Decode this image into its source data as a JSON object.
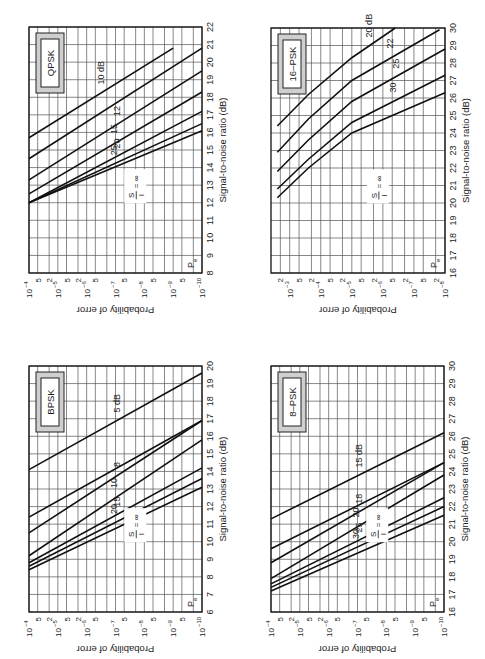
{
  "figure": {
    "orientation": "rotated-90-ccw",
    "shared_xlabel": "Signal-to-noise ratio (dB)",
    "shared_ylabel": "Probability of error",
    "pe_label": "P",
    "pe_subscript": "e",
    "si_label": {
      "num": "S",
      "den": "I",
      "eq": "= ∞"
    }
  },
  "chart_data": [
    {
      "id": "bpsk",
      "type": "line",
      "title": "BPSK",
      "xlabel": "Signal-to-noise ratio (dB)",
      "ylabel": "Probability of error",
      "xlim": [
        6,
        20
      ],
      "ylim": [
        1e-10,
        0.0001
      ],
      "yscale": "log",
      "grid": true,
      "x_ticks": [
        6,
        7,
        8,
        9,
        10,
        11,
        12,
        13,
        14,
        15,
        16,
        17,
        18,
        19,
        20
      ],
      "y_tick_labels": [
        "10⁻⁴",
        "5",
        "2",
        "10⁻⁵",
        "5",
        "2",
        "10⁻⁶",
        "5",
        "10⁻⁷",
        "5",
        "10⁻⁸",
        "5",
        "10⁻⁹",
        "5",
        "10⁻¹⁰"
      ],
      "series": [
        {
          "name": "S/I = ∞",
          "label": "",
          "x": [
            8.4,
            13.1
          ],
          "y": [
            0.0001,
            1e-10
          ]
        },
        {
          "name": "20 dB",
          "label": "20",
          "x": [
            8.6,
            13.6
          ],
          "y": [
            0.0001,
            1e-10
          ]
        },
        {
          "name": "15 dB",
          "label": "15",
          "x": [
            8.8,
            14.2
          ],
          "y": [
            0.0001,
            1e-10
          ]
        },
        {
          "name": "10 dB",
          "label": "10",
          "x": [
            9.2,
            15.8
          ],
          "y": [
            0.0001,
            1e-10
          ]
        },
        {
          "name": "8 dB",
          "label": "8",
          "x": [
            10.5,
            16.9
          ],
          "y": [
            0.0001,
            1e-10
          ]
        },
        {
          "name": "8 dB top",
          "label": "",
          "x": [
            11.4,
            16.9
          ],
          "y": [
            0.0001,
            1e-10
          ]
        },
        {
          "name": "5 dB",
          "label": "5 dB",
          "x": [
            14.1,
            19.6
          ],
          "y": [
            0.0001,
            1e-10
          ]
        }
      ]
    },
    {
      "id": "qpsk",
      "type": "line",
      "title": "QPSK",
      "xlabel": "Signal-to-noise ratio (dB)",
      "ylabel": "Probability of error",
      "xlim": [
        8,
        22
      ],
      "ylim": [
        1e-10,
        0.0001
      ],
      "yscale": "log",
      "grid": true,
      "x_ticks": [
        8,
        9,
        10,
        11,
        12,
        13,
        14,
        15,
        16,
        17,
        18,
        19,
        20,
        21,
        22
      ],
      "y_tick_labels": [
        "10⁻⁴",
        "5",
        "2",
        "10⁻⁵",
        "5",
        "2",
        "10⁻⁶",
        "5",
        "10⁻⁷",
        "5",
        "10⁻⁸",
        "5",
        "10⁻⁹",
        "5",
        "10⁻¹⁰"
      ],
      "series": [
        {
          "name": "S/I = ∞",
          "label": "",
          "x": [
            12.0,
            16.1
          ],
          "y": [
            0.0001,
            1e-10
          ]
        },
        {
          "name": "25 dB",
          "label": "25",
          "x": [
            12.0,
            16.5
          ],
          "y": [
            0.0001,
            1e-10
          ]
        },
        {
          "name": "20 dB",
          "label": "20",
          "x": [
            12.0,
            17.2
          ],
          "y": [
            0.0001,
            1e-10
          ]
        },
        {
          "name": "15 dB",
          "label": "15",
          "x": [
            12.5,
            18.3
          ],
          "y": [
            0.0001,
            1e-10
          ]
        },
        {
          "name": "12 dB",
          "label": "12",
          "x": [
            13.3,
            19.5
          ],
          "y": [
            0.0001,
            1e-10
          ]
        },
        {
          "name": "10 dB a",
          "label": "",
          "x": [
            14.5,
            20.8
          ],
          "y": [
            0.0001,
            1e-10
          ]
        },
        {
          "name": "10 dB",
          "label": "10 dB",
          "x": [
            15.7,
            20.8
          ],
          "y": [
            0.0001,
            1e-09
          ]
        }
      ]
    },
    {
      "id": "8psk",
      "type": "line",
      "title": "8–PSK",
      "xlabel": "Signal-to-noise ratio (dB)",
      "ylabel": "Probability of error",
      "xlim": [
        16,
        30
      ],
      "ylim": [
        1e-10,
        0.0001
      ],
      "yscale": "log",
      "grid": true,
      "x_ticks": [
        16,
        17,
        18,
        19,
        20,
        21,
        22,
        23,
        24,
        25,
        26,
        27,
        28,
        29,
        30
      ],
      "y_tick_labels": [
        "10⁻⁴",
        "5",
        "2",
        "10⁻⁵",
        "5",
        "2",
        "10⁻⁶",
        "5",
        "10⁻⁷",
        "5",
        "10⁻⁸",
        "5",
        "10⁻⁹",
        "5",
        "10⁻¹⁰"
      ],
      "series": [
        {
          "name": "S/I = ∞",
          "label": "",
          "x": [
            17.2,
            21.5
          ],
          "y": [
            0.0001,
            1e-10
          ]
        },
        {
          "name": "30 dB",
          "label": "30",
          "x": [
            17.4,
            22.0
          ],
          "y": [
            0.0001,
            1e-10
          ]
        },
        {
          "name": "25 dB",
          "label": "25",
          "x": [
            17.6,
            22.5
          ],
          "y": [
            0.0001,
            1e-10
          ]
        },
        {
          "name": "20 dB",
          "label": "20",
          "x": [
            17.9,
            23.8
          ],
          "y": [
            0.0001,
            1e-10
          ]
        },
        {
          "name": "18 dB",
          "label": "18",
          "x": [
            18.8,
            24.5
          ],
          "y": [
            0.0001,
            1e-10
          ]
        },
        {
          "name": "18 dB b",
          "label": "",
          "x": [
            19.6,
            24.5
          ],
          "y": [
            0.0001,
            1e-10
          ]
        },
        {
          "name": "15 dB",
          "label": "15 dB",
          "x": [
            21.3,
            26.2
          ],
          "y": [
            0.0001,
            1e-10
          ]
        }
      ]
    },
    {
      "id": "16psk",
      "type": "line",
      "title": "16–PSK",
      "xlabel": "Signal-to-noise ratio (dB)",
      "ylabel": "Probability of error",
      "xlim": [
        16,
        30
      ],
      "ylim": [
        1e-08,
        0.004
      ],
      "yscale": "log",
      "grid": true,
      "x_ticks": [
        16,
        17,
        18,
        19,
        20,
        21,
        22,
        23,
        24,
        25,
        26,
        27,
        28,
        29,
        30
      ],
      "y_tick_labels": [
        "2",
        "10⁻³",
        "5",
        "2",
        "10⁻⁴",
        "5",
        "10⁻⁵",
        "5",
        "10⁻⁶",
        "5",
        "10⁻⁷",
        "5",
        "10⁻⁸"
      ],
      "series": [
        {
          "name": "S/I = ∞",
          "label": "",
          "x": [
            20.3,
            22.0,
            24.0,
            26.3
          ],
          "y": [
            0.0025,
            0.00025,
            1e-05,
            1e-08
          ]
        },
        {
          "name": "30 dB",
          "label": "30",
          "x": [
            20.8,
            22.5,
            24.6,
            27.3
          ],
          "y": [
            0.0025,
            0.00025,
            1e-05,
            1e-08
          ]
        },
        {
          "name": "25 dB",
          "label": "25",
          "x": [
            21.8,
            23.6,
            25.8,
            28.8
          ],
          "y": [
            0.0025,
            0.00025,
            1e-05,
            1e-08
          ]
        },
        {
          "name": "22 dB",
          "label": "22",
          "x": [
            22.9,
            24.8,
            27.0,
            29.9
          ],
          "y": [
            0.0025,
            0.00025,
            1e-05,
            1.5e-08
          ]
        },
        {
          "name": "20 dB",
          "label": "20 dB",
          "x": [
            24.4,
            26.2,
            28.3,
            30.0
          ],
          "y": [
            0.0025,
            0.00025,
            1e-05,
            4e-07
          ]
        }
      ]
    }
  ]
}
